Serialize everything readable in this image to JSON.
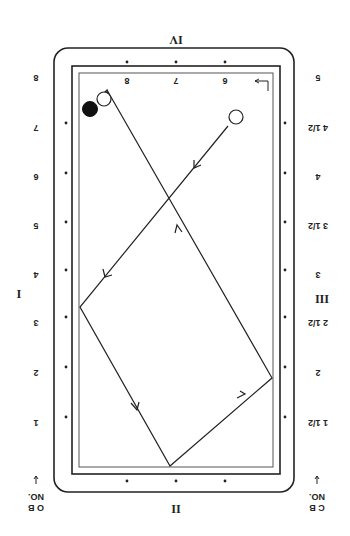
{
  "diagram": {
    "type": "billiards-table-shot-diagram",
    "orientation": "rotated-180",
    "rail_labels": {
      "top": "IV",
      "bottom": "II",
      "left": "I",
      "right": "III"
    },
    "corner_labels": {
      "bottom_left": {
        "line1": "NO.",
        "line2": "O B"
      },
      "bottom_right": {
        "line1": "NO.",
        "line2": "C B"
      }
    },
    "left_diamond_numbers": [
      "8",
      "7",
      "6",
      "5",
      "4",
      "3",
      "2",
      "1"
    ],
    "right_diamond_numbers": [
      "5",
      "4 1/2",
      "4",
      "3 1/2",
      "3",
      "2 1/2",
      "2",
      "1 1/2"
    ],
    "inner_top_numbers": [
      "8",
      "7",
      "6"
    ],
    "balls": [
      {
        "name": "object-ball-white",
        "color": "#ffffff",
        "x": 104,
        "y": 99
      },
      {
        "name": "object-ball-black",
        "color": "#111111",
        "x": 90,
        "y": 109
      },
      {
        "name": "cue-ball-white",
        "color": "#ffffff",
        "x": 236,
        "y": 117
      }
    ],
    "path": [
      {
        "x": 228,
        "y": 126
      },
      {
        "x": 80,
        "y": 307
      },
      {
        "x": 170,
        "y": 466
      },
      {
        "x": 272,
        "y": 378
      },
      {
        "x": 107,
        "y": 90
      }
    ]
  }
}
